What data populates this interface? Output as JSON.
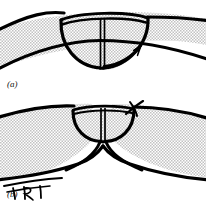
{
  "figure": {
    "type": "line-diagram",
    "panels": [
      {
        "id": "a",
        "caption": "(a)",
        "elements": [
          "curved-stippled-band",
          "pouch-flap",
          "vertical-septum",
          "rotation-arrow"
        ],
        "arrow": {
          "name": "rotation-arrow",
          "direction": "up-right",
          "description": "curved arrow sweeping rightward and upward along the pouch rim"
        }
      },
      {
        "id": "b",
        "caption": "(b)",
        "elements": [
          "curved-stippled-band",
          "pouch-flap",
          "vertical-septum",
          "suture-mark",
          "splayed-legs",
          "white-wedge"
        ],
        "suture": {
          "name": "suture-mark",
          "description": "small crossing stitch mark at the right side of the pouch rim"
        }
      }
    ],
    "annotation": {
      "name": "artist-signature",
      "text": "TRT",
      "style": "handwritten",
      "position": "lower-left of panel b"
    },
    "colors": {
      "ink": "#000000",
      "background": "#ffffff",
      "stipple": "#b8b8b8",
      "caption": "#111111"
    },
    "stroke": {
      "outline_width": 3.2,
      "septum_width": 1.6,
      "arrow_width": 2.6
    }
  }
}
